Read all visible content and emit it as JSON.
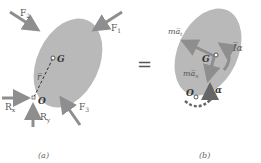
{
  "diagram": {
    "colors": {
      "body_fill": "#b9b9b9",
      "arrow": "#8e8e8e",
      "text": "#555555",
      "dark_arrow": "#666666"
    },
    "panel_a": {
      "caption": "(a)",
      "forces": {
        "F1": "F",
        "F1_sub": "1",
        "F2": "F",
        "F2_sub": "2",
        "F3": "F",
        "F3_sub": "3",
        "Rx": "R",
        "Rx_sub": "x",
        "Ry": "R",
        "Ry_sub": "y"
      },
      "points": {
        "G": "G",
        "O": "O"
      },
      "vector": "r̅"
    },
    "equals": "=",
    "panel_b": {
      "caption": "(b)",
      "labels": {
        "ma_t": "ma̅",
        "ma_t_sub": "t",
        "ma_n": "ma̅",
        "ma_n_sub": "n",
        "I_alpha": "I̅α",
        "alpha": "α"
      },
      "points": {
        "G": "G",
        "O": "O"
      }
    }
  }
}
